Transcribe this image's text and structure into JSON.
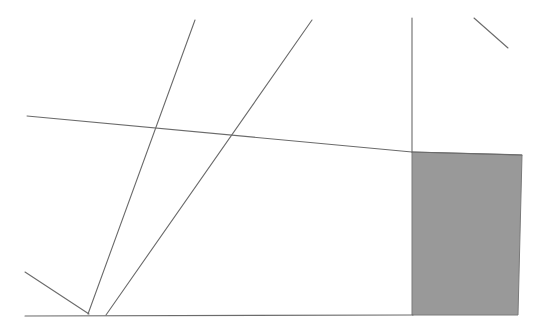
{
  "figure": {
    "type": "line-drawing",
    "canvas": {
      "width": 538,
      "height": 336
    },
    "background_color": "#ffffff",
    "stroke_color": "#6b6b6b",
    "stroke_width": 1.1,
    "shaded_region": {
      "name": "shaded-quadrilateral",
      "fill_color": "#999999",
      "stroke_color": "#7a7a7a",
      "points": "412,152 522,155 518,315 412,315"
    },
    "lines": [
      {
        "name": "baseline",
        "label": "horizontal baseline",
        "x1": 25,
        "y1": 316,
        "x2": 413,
        "y2": 315
      },
      {
        "name": "shallow-transversal",
        "label": "shallow descending transversal",
        "x1": 27,
        "y1": 116,
        "x2": 412,
        "y2": 152
      },
      {
        "name": "steep-left-ray",
        "label": "steep ray from upper-left to baseline",
        "x1": 195,
        "y1": 20,
        "x2": 88,
        "y2": 314
      },
      {
        "name": "steep-right-ray",
        "label": "steep ray from upper-right to baseline",
        "x1": 312,
        "y1": 20,
        "x2": 106,
        "y2": 315
      },
      {
        "name": "short-lower-left-segment",
        "label": "short segment meeting baseline at left",
        "x1": 25,
        "y1": 272,
        "x2": 89,
        "y2": 314
      },
      {
        "name": "vertical-divider",
        "label": "near-vertical line descending to shaded region",
        "x1": 412,
        "y1": 18,
        "x2": 412,
        "y2": 152
      },
      {
        "name": "short-upper-right-segment",
        "label": "short diagonal segment in upper right corner",
        "x1": 474,
        "y1": 18,
        "x2": 508,
        "y2": 48
      },
      {
        "name": "shaded-top-edge",
        "label": "top edge of shaded region",
        "x1": 412,
        "y1": 152,
        "x2": 522,
        "y2": 155
      }
    ],
    "vertices": [
      {
        "name": "triple-intersection",
        "x": 230,
        "y": 134
      },
      {
        "name": "baseline-left-meet",
        "x": 88,
        "y": 314
      },
      {
        "name": "baseline-right-meet",
        "x": 106,
        "y": 315
      },
      {
        "name": "shaded-top-left-corner",
        "x": 412,
        "y": 152
      },
      {
        "name": "shaded-top-right-corner",
        "x": 522,
        "y": 155
      },
      {
        "name": "shaded-bottom-right-corner",
        "x": 518,
        "y": 315
      },
      {
        "name": "shaded-bottom-left-corner",
        "x": 412,
        "y": 315
      }
    ]
  }
}
